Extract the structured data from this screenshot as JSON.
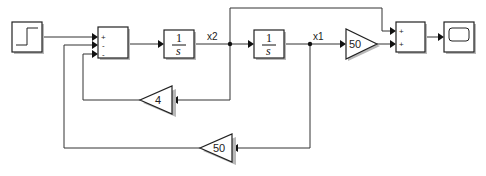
{
  "diagram": {
    "type": "simulink-block-diagram",
    "blocks": {
      "step": {
        "kind": "Step"
      },
      "sum1": {
        "kind": "Sum",
        "signs": [
          "+",
          "-",
          "-"
        ]
      },
      "integrator1": {
        "kind": "Integrator",
        "num": "1",
        "den": "s"
      },
      "integrator2": {
        "kind": "Integrator",
        "num": "1",
        "den": "s"
      },
      "gain_forward": {
        "kind": "Gain",
        "value": "50"
      },
      "gain_feedback_x2": {
        "kind": "Gain",
        "value": "4"
      },
      "gain_feedback_x1": {
        "kind": "Gain",
        "value": "50"
      },
      "sum2": {
        "kind": "Sum",
        "signs": [
          "+",
          "+"
        ]
      },
      "scope": {
        "kind": "Scope"
      }
    },
    "signals": {
      "x2": "x2",
      "x1": "x1"
    },
    "connections": [
      "step -> sum1.in1 (+)",
      "sum1 -> integrator1",
      "integrator1 -> x2 junction",
      "x2 -> integrator2",
      "x2 -> sum2.in1 (+)",
      "x2 -> gain 4 -> sum1.in3 (-)",
      "integrator2 -> x1 junction",
      "x1 -> gain 50 -> sum2.in2 (+)",
      "x1 -> gain 50 -> sum1.in2 (-)",
      "sum2 -> scope"
    ]
  }
}
